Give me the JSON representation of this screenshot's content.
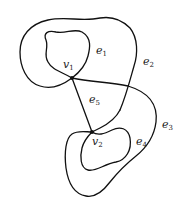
{
  "diagram": {
    "type": "graph",
    "vertices": [
      {
        "id": "v1",
        "base": "v",
        "sub": "1"
      },
      {
        "id": "v2",
        "base": "v",
        "sub": "2"
      }
    ],
    "edges": [
      {
        "id": "e1",
        "base": "e",
        "sub": "1",
        "kind": "loop",
        "at": "v1"
      },
      {
        "id": "e2",
        "base": "e",
        "sub": "2",
        "kind": "loop",
        "at": "v1"
      },
      {
        "id": "e5",
        "base": "e",
        "sub": "5",
        "kind": "edge",
        "from": "v1",
        "to": "v2"
      },
      {
        "id": "e3",
        "base": "e",
        "sub": "3",
        "kind": "edge",
        "from": "v1",
        "to": "v2"
      },
      {
        "id": "e4",
        "base": "e",
        "sub": "4",
        "kind": "loop",
        "at": "v2"
      }
    ],
    "stroke_color": "#111111",
    "background_color": "#ffffff"
  }
}
